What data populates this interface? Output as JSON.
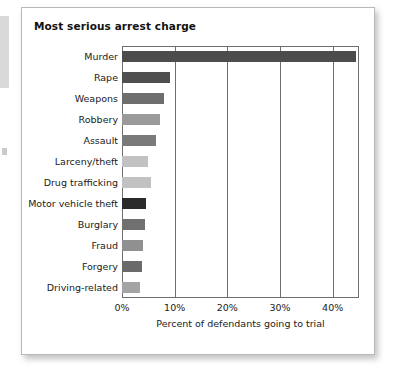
{
  "figure": {
    "title": "Most serious arrest charge"
  },
  "chart_data": {
    "type": "bar",
    "orientation": "horizontal",
    "title": "Most serious arrest charge",
    "xlabel": "Percent of defendants going to trial",
    "ylabel": "",
    "xlim": [
      0,
      45
    ],
    "xticks": [
      0,
      10,
      20,
      30,
      40
    ],
    "xticklabels": [
      "0%",
      "10%",
      "20%",
      "30%",
      "40%"
    ],
    "grid": "vertical",
    "legend": "none",
    "categories": [
      "Murder",
      "Rape",
      "Weapons",
      "Robbery",
      "Assault",
      "Larceny/theft",
      "Drug trafficking",
      "Motor vehicle theft",
      "Burglary",
      "Fraud",
      "Forgery",
      "Driving-related"
    ],
    "values": [
      44.5,
      9.1,
      8.0,
      7.3,
      6.4,
      5.0,
      5.5,
      4.5,
      4.4,
      4.0,
      3.8,
      3.4
    ],
    "bar_colors": [
      "#4c4c4c",
      "#4f4f4f",
      "#6e6e6e",
      "#9a9a9a",
      "#7a7a7a",
      "#c2c2c2",
      "#c2c2c2",
      "#2b2b2b",
      "#707070",
      "#909090",
      "#6a6a6a",
      "#a4a4a4"
    ]
  }
}
